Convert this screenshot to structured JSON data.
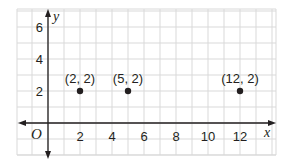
{
  "chart_data": {
    "type": "scatter",
    "title": "",
    "xlabel": "x",
    "ylabel": "y",
    "origin_label": "O",
    "xlim": [
      -2,
      14.5
    ],
    "ylim": [
      -1.6,
      7
    ],
    "grid": true,
    "x_ticks": [
      2,
      4,
      6,
      8,
      10,
      12
    ],
    "y_ticks": [
      2,
      4,
      6
    ],
    "x_tick_labels": [
      "2",
      "4",
      "6",
      "8",
      "10",
      "12"
    ],
    "y_tick_labels": [
      "2",
      "4",
      "6"
    ],
    "points": [
      {
        "x": 2,
        "y": 2,
        "label": "(2, 2)"
      },
      {
        "x": 5,
        "y": 2,
        "label": "(5, 2)"
      },
      {
        "x": 12,
        "y": 2,
        "label": "(12, 2)"
      }
    ],
    "colors": {
      "grid": "#d9d9d9",
      "axis": "#231f20",
      "point": "#231f20"
    }
  }
}
